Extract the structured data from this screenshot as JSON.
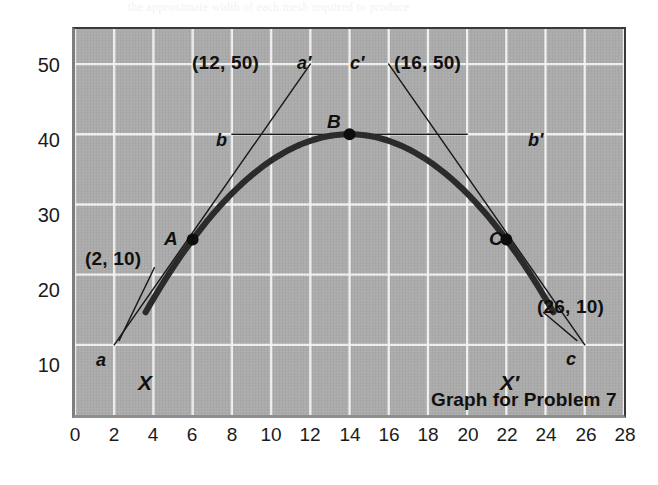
{
  "figure": {
    "caption": "Graph for Problem 7",
    "bleed_text": "the approximate width of each mesh required to produce"
  },
  "chart_data": {
    "type": "line",
    "title": "Graph for Problem 7",
    "xlabel": "",
    "ylabel": "",
    "xlim": [
      0,
      28
    ],
    "ylim": [
      0,
      55
    ],
    "grid": true,
    "legend_position": "none",
    "background_color": "#ababab",
    "grid_color": "#f5f5f5",
    "curve_color": "#2b2b2b",
    "tangent_color": "#1a1a1a",
    "x_ticks": [
      0,
      2,
      4,
      6,
      8,
      10,
      12,
      14,
      16,
      18,
      20,
      22,
      24,
      26,
      28
    ],
    "y_ticks": [
      10,
      20,
      30,
      40,
      50
    ],
    "x_tick_labels": [
      "0",
      "2",
      "4",
      "6",
      "8",
      "10",
      "12",
      "14",
      "16",
      "18",
      "20",
      "22",
      "24",
      "26",
      "28"
    ],
    "y_tick_labels": [
      "10",
      "20",
      "30",
      "40",
      "50"
    ],
    "series": [
      {
        "name": "curve X X'",
        "type": "parabola",
        "endpoint_labels": [
          "X",
          "X'"
        ],
        "x": [
          3.6,
          4,
          5,
          6,
          7,
          8,
          9,
          10,
          11,
          12,
          13,
          14,
          15,
          16,
          17,
          18,
          19,
          20,
          21,
          22,
          23,
          24,
          24.4
        ],
        "y": [
          8.3,
          11.1,
          18.1,
          24.4,
          30.0,
          34.9,
          39.0,
          38.4,
          39.7,
          40.0,
          40.0,
          40.0,
          39.7,
          38.4,
          37.2,
          34.9,
          32.0,
          28.4,
          24.4,
          25.0,
          15.6,
          11.1,
          8.3
        ]
      }
    ],
    "points": [
      {
        "label": "A",
        "x": 6,
        "y": 25
      },
      {
        "label": "B",
        "x": 14,
        "y": 40
      },
      {
        "label": "C",
        "x": 22,
        "y": 25
      }
    ],
    "tangent_lines": [
      {
        "name": "tangent at A",
        "from_label": "a",
        "to_label": "a'",
        "from": {
          "x": 2,
          "y": 10,
          "text": "(2, 10)"
        },
        "to": {
          "x": 12,
          "y": 50,
          "text": "(12, 50)"
        },
        "touches_point": "A"
      },
      {
        "name": "tangent at B",
        "from_label": "b",
        "to_label": "b'",
        "from": {
          "x": 8,
          "y": 40,
          "text": ""
        },
        "to": {
          "x": 20,
          "y": 40,
          "text": ""
        },
        "touches_point": "B"
      },
      {
        "name": "tangent at C",
        "from_label": "c'",
        "to_label": "c",
        "from": {
          "x": 16,
          "y": 50,
          "text": "(16, 50)"
        },
        "to": {
          "x": 26,
          "y": 10,
          "text": "(26, 10)"
        },
        "touches_point": "C"
      }
    ],
    "annotations": [
      {
        "name": "coord-a-prime",
        "text": "(12, 50)"
      },
      {
        "name": "coord-c-prime",
        "text": "(16, 50)"
      },
      {
        "name": "coord-a",
        "text": "(2, 10)"
      },
      {
        "name": "coord-c",
        "text": "(26, 10)"
      },
      {
        "name": "label-a-prime",
        "text": "a′"
      },
      {
        "name": "label-c-prime",
        "text": "c′"
      },
      {
        "name": "label-a",
        "text": "a"
      },
      {
        "name": "label-c",
        "text": "c"
      },
      {
        "name": "label-b",
        "text": "b"
      },
      {
        "name": "label-b-prime",
        "text": "b′"
      },
      {
        "name": "label-A",
        "text": "A"
      },
      {
        "name": "label-B",
        "text": "B"
      },
      {
        "name": "label-C",
        "text": "C"
      },
      {
        "name": "label-X",
        "text": "X"
      },
      {
        "name": "label-X-prime",
        "text": "X′"
      }
    ]
  }
}
